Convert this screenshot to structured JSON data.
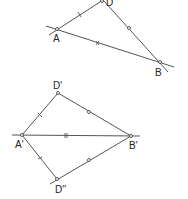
{
  "figure_top": {
    "points": {
      "A": {
        "label": "A",
        "x": 57,
        "y": 29
      },
      "B": {
        "label": "B",
        "x": 160,
        "y": 62
      },
      "D": {
        "label": "D",
        "x": 102,
        "y": 0
      }
    },
    "segments": [
      {
        "from": "A",
        "to": "D",
        "marks": "|"
      },
      {
        "from": "D",
        "to": "B",
        "marks": "o"
      },
      {
        "from": "A",
        "to": "B",
        "marks": "x",
        "extended": true
      }
    ]
  },
  "figure_bottom": {
    "points": {
      "A1": {
        "label": "A'",
        "x": 22,
        "y": 135
      },
      "B1": {
        "label": "B'",
        "x": 131,
        "y": 136
      },
      "D1": {
        "label": "D'",
        "x": 58,
        "y": 93
      },
      "D2": {
        "label": "D''",
        "x": 57,
        "y": 179
      }
    },
    "segments": [
      {
        "from": "A'",
        "to": "D'",
        "marks": "|"
      },
      {
        "from": "D'",
        "to": "B'",
        "marks": "o"
      },
      {
        "from": "A'",
        "to": "B'",
        "marks": "x",
        "extended": true
      },
      {
        "from": "A'",
        "to": "D''",
        "marks": "|"
      },
      {
        "from": "D''",
        "to": "B'",
        "marks": "o"
      }
    ]
  }
}
